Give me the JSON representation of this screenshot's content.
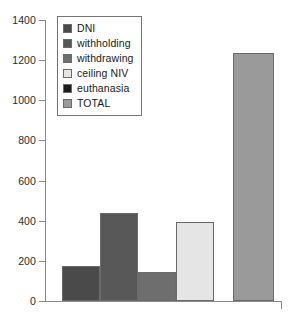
{
  "chart_data": {
    "type": "bar",
    "title": "",
    "subtitle": "",
    "xlabel": "",
    "ylabel": "",
    "categories": [
      "DNI",
      "withholding",
      "withdrawing",
      "ceiling NIV",
      "euthanasia",
      "TOTAL"
    ],
    "values": [
      175,
      437,
      143,
      392,
      0,
      1235
    ],
    "series": [
      {
        "name": "count",
        "values": [
          175,
          437,
          143,
          392,
          0,
          1235
        ]
      }
    ],
    "ylim": [
      0,
      1400
    ],
    "yticks": [
      0,
      200,
      400,
      600,
      800,
      1000,
      1200,
      1400
    ],
    "ytick_labels": [
      "0",
      "200",
      "400",
      "600",
      "800",
      "1000",
      "1200",
      "1400"
    ],
    "xtick_labels": [],
    "grid": false,
    "legend_position": "upper-left",
    "colors": [
      "#4a4a4a",
      "#585858",
      "#6e6e6e",
      "#e5e5e5",
      "#1c1c1c",
      "#9a9a9a"
    ],
    "bar_edge_color": "#6b6b6b",
    "axis_color": "#8a8a8a"
  },
  "legend": {
    "items": [
      {
        "label": "DNI",
        "color": "#4a4a4a"
      },
      {
        "label": "withholding",
        "color": "#585858"
      },
      {
        "label": "withdrawing",
        "color": "#6e6e6e"
      },
      {
        "label": "ceiling NIV",
        "color": "#e5e5e5"
      },
      {
        "label": "euthanasia",
        "color": "#1c1c1c"
      },
      {
        "label": "TOTAL",
        "color": "#9a9a9a"
      }
    ]
  }
}
